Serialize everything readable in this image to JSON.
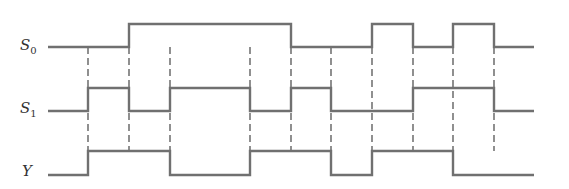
{
  "diagram": {
    "signals": [
      {
        "name": "S",
        "subscript": "0",
        "label_y": 40,
        "high_y": 24,
        "low_y": 47,
        "levels": [
          0,
          0,
          1,
          1,
          1,
          1,
          0,
          0,
          1,
          0,
          1,
          0
        ]
      },
      {
        "name": "S",
        "subscript": "1",
        "label_y": 103,
        "high_y": 88,
        "low_y": 111,
        "levels": [
          0,
          1,
          0,
          1,
          1,
          0,
          1,
          0,
          0,
          1,
          1,
          0
        ]
      },
      {
        "name": "Y",
        "subscript": "",
        "label_y": 166,
        "high_y": 151,
        "low_y": 175,
        "levels": [
          0,
          1,
          1,
          0,
          0,
          1,
          1,
          0,
          1,
          1,
          0,
          0
        ]
      }
    ],
    "time_edges": [
      48,
      88,
      129,
      170,
      210,
      250,
      291,
      331,
      372,
      413,
      453,
      494,
      534
    ],
    "dashed_guides_x": [
      88,
      129,
      170,
      250,
      291,
      331,
      372,
      413,
      453,
      494
    ],
    "dash_top_y": 47,
    "dash_bottom_y": 151,
    "colors": {
      "waveform": "#707070",
      "guide": "#555555",
      "label": "#333333"
    }
  }
}
